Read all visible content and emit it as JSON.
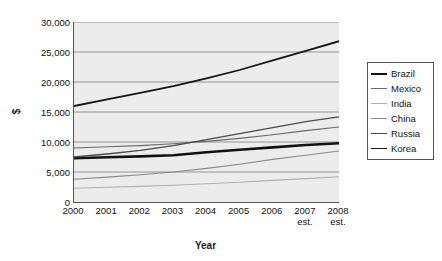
{
  "chart_data": {
    "type": "line",
    "title": "",
    "xlabel": "Year",
    "ylabel": "$",
    "x": [
      "2000",
      "2001",
      "2002",
      "2003",
      "2004",
      "2005",
      "2006",
      "2007",
      "2008"
    ],
    "x_tick_notes": [
      "",
      "",
      "",
      "",
      "",
      "",
      "",
      "est.",
      "est."
    ],
    "ylim": [
      0,
      30000
    ],
    "y_ticks": [
      "0",
      "5,000",
      "10,000",
      "15,000",
      "20,000",
      "25,000",
      "30,000"
    ],
    "y_tick_values": [
      0,
      5000,
      10000,
      15000,
      20000,
      25000,
      30000
    ],
    "grid": true,
    "legend_position": "right",
    "series": [
      {
        "name": "Brazil",
        "color": "#111111",
        "width": 2.6,
        "values": [
          7300,
          7450,
          7600,
          7800,
          8300,
          8700,
          9100,
          9500,
          9800
        ]
      },
      {
        "name": "Mexico",
        "color": "#6a6a6a",
        "width": 1.1,
        "values": [
          9000,
          9200,
          9400,
          9700,
          10100,
          10600,
          11200,
          11900,
          12500
        ]
      },
      {
        "name": "India",
        "color": "#b0b0b0",
        "width": 1.1,
        "values": [
          2300,
          2450,
          2600,
          2800,
          3050,
          3300,
          3600,
          3900,
          4200
        ]
      },
      {
        "name": "China",
        "color": "#8a8a8a",
        "width": 1.1,
        "values": [
          3800,
          4150,
          4550,
          5000,
          5600,
          6300,
          7100,
          7800,
          8500
        ]
      },
      {
        "name": "Russia",
        "color": "#4a4a4a",
        "width": 1.3,
        "values": [
          7500,
          8000,
          8600,
          9400,
          10400,
          11400,
          12400,
          13400,
          14200
        ]
      },
      {
        "name": "Korea",
        "color": "#161616",
        "width": 1.8,
        "values": [
          16000,
          17100,
          18200,
          19300,
          20600,
          22000,
          23600,
          25200,
          26800
        ]
      }
    ]
  },
  "legend": {
    "items": [
      {
        "label": "Brazil"
      },
      {
        "label": "Mexico"
      },
      {
        "label": "India"
      },
      {
        "label": "China"
      },
      {
        "label": "Russia"
      },
      {
        "label": "Korea"
      }
    ]
  }
}
